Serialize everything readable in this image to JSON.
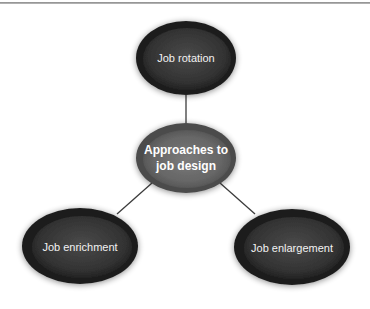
{
  "diagram": {
    "type": "hub-and-spoke",
    "center": {
      "id": "center",
      "label": "Approaches to job design",
      "line1": "Approaches to",
      "line2": "job design",
      "cx": 186,
      "cy": 158,
      "rx": 50,
      "ry": 35
    },
    "nodes": [
      {
        "id": "rotation",
        "label": "Job rotation",
        "cx": 186,
        "cy": 58,
        "rx": 50,
        "ry": 37
      },
      {
        "id": "enrichment",
        "label": "Job enrichment",
        "cx": 80,
        "cy": 246,
        "rx": 58,
        "ry": 38
      },
      {
        "id": "enlargement",
        "label": "Job enlargement",
        "cx": 292,
        "cy": 247,
        "rx": 58,
        "ry": 38
      }
    ],
    "edges": [
      {
        "from": "center",
        "to": "rotation"
      },
      {
        "from": "center",
        "to": "enrichment"
      },
      {
        "from": "center",
        "to": "enlargement"
      }
    ],
    "colors": {
      "outer_node_fill": "#3a3a3a",
      "outer_node_rim": "#1a1a1a",
      "center_node_fill": "#6e6e6e",
      "center_node_rim": "#4a4a4a",
      "connector": "#3c3c3c",
      "label_text": "#f2f2f2",
      "top_rule": "#9a9a9a"
    }
  }
}
